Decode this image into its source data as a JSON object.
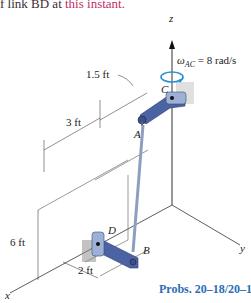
{
  "header_text": {
    "prefix": "f link BD at ",
    "highlight": "this instant."
  },
  "figure": {
    "axes": {
      "z": "z",
      "y": "y",
      "x": "x"
    },
    "points": {
      "A": "A",
      "B": "B",
      "C": "C",
      "D": "D"
    },
    "angular_velocity": {
      "symbol": "ω",
      "subscript": "AC",
      "value_text": " = 8 rad/s"
    },
    "dimensions": {
      "d1": "1.5 ft",
      "d2": "3 ft",
      "d3": "6 ft",
      "d4": "2 ft"
    },
    "colors": {
      "link": "#5a6fa8",
      "rod": "#9aa9c8",
      "caption": "#2b6db5",
      "rotation_arrow": "#2a8fd0"
    }
  },
  "caption": "Probs. 20–18/20–19"
}
